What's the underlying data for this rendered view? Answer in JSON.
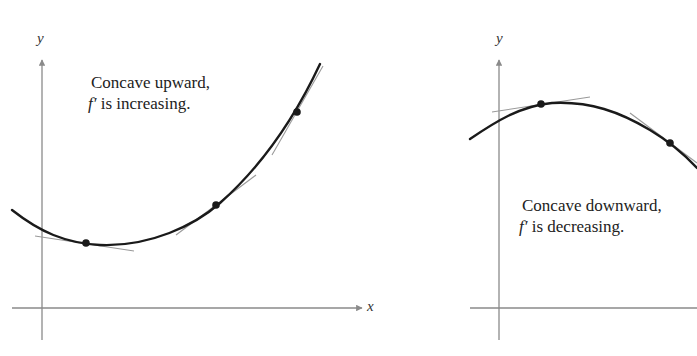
{
  "panels": [
    {
      "id": "left",
      "caption_line1": "Concave upward,",
      "caption_line2_fn": "f′",
      "caption_line2_rest": " is increasing.",
      "x_axis_label": "x",
      "y_axis_label": "y"
    },
    {
      "id": "right",
      "caption_line1": "Concave downward,",
      "caption_line2_fn": "f′",
      "caption_line2_rest": " is decreasing.",
      "y_axis_label": "y"
    }
  ],
  "colors": {
    "curve": "#1a1a1a",
    "axis": "#8a8a8a",
    "tangent": "#9a9a9a",
    "point": "#1a1a1a"
  }
}
